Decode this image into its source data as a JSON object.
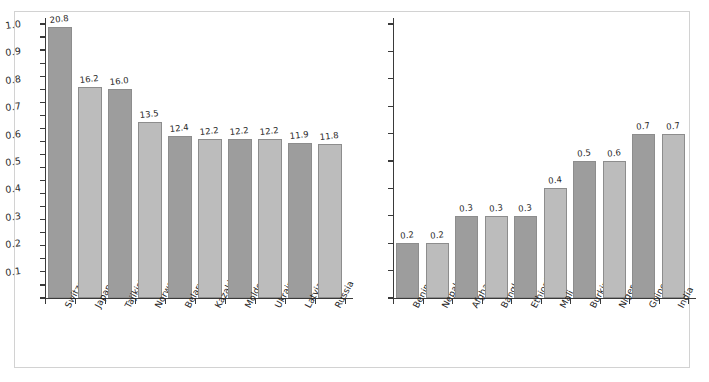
{
  "figure": {
    "background": "#ffffff",
    "frame_color": "#d2d2d2",
    "axis_color": "#3a3a3a",
    "bar_color_dark": "#9d9d9d",
    "bar_color_light": "#bcbcbc",
    "style": "hand-drawn",
    "panel_count": 2
  },
  "chart_data": [
    {
      "type": "bar",
      "title": "",
      "xlabel": "",
      "ylabel": "",
      "ylim": [
        0,
        21
      ],
      "grid": false,
      "legend": null,
      "yticks": [
        0,
        1,
        2,
        3,
        4,
        5,
        6,
        7,
        8,
        9,
        10,
        11,
        12,
        13,
        14,
        15,
        16,
        17,
        18,
        19,
        20,
        21
      ],
      "ytick_labels": [
        "0",
        "1",
        "2",
        "3",
        "4",
        "5",
        "6",
        "7",
        "8",
        "9",
        "10",
        "11",
        "12",
        "13",
        "14",
        "15",
        "16",
        "17",
        "18",
        "19",
        "20",
        "21"
      ],
      "categories": [
        "Switzerland",
        "Japan",
        "Tajikistan",
        "Norway",
        "Belarus",
        "Kazakhstan",
        "Moldova",
        "Ukraine",
        "Latvia",
        "Russia"
      ],
      "values": [
        20.8,
        16.2,
        16.0,
        13.5,
        12.4,
        12.2,
        12.2,
        12.2,
        11.9,
        11.8
      ],
      "bar_heights": [
        20.8,
        16.2,
        16.0,
        13.5,
        12.4,
        12.2,
        12.2,
        12.2,
        11.9,
        11.8
      ],
      "value_labels": [
        "20.8",
        "16.2",
        "16.0",
        "13.5",
        "12.4",
        "12.2",
        "12.2",
        "12.2",
        "11.9",
        "11.8"
      ]
    },
    {
      "type": "bar",
      "title": "",
      "xlabel": "",
      "ylabel": "",
      "ylim": [
        0,
        1.0
      ],
      "grid": false,
      "legend": null,
      "yticks": [
        0,
        0.1,
        0.2,
        0.3,
        0.4,
        0.5,
        0.6,
        0.7,
        0.8,
        0.9,
        1.0
      ],
      "ytick_labels": [
        "0",
        "0.1",
        "0.2",
        "0.3",
        "0.4",
        "0.5",
        "0.6",
        "0.7",
        "0.8",
        "0.9",
        "1.0"
      ],
      "categories": [
        "Benin",
        "Nepal",
        "Afghanistan",
        "Bangladesh",
        "Ethiopia",
        "Mali",
        "Burkina",
        "Niger",
        "Guinea",
        "India"
      ],
      "values": [
        0.2,
        0.2,
        0.3,
        0.3,
        0.3,
        0.4,
        0.5,
        0.6,
        0.7,
        0.7
      ],
      "bar_heights": [
        0.2,
        0.2,
        0.3,
        0.3,
        0.3,
        0.4,
        0.5,
        0.5,
        0.6,
        0.6
      ],
      "value_labels": [
        "0.2",
        "0.2",
        "0.3",
        "0.3",
        "0.3",
        "0.4",
        "0.5",
        "0.6",
        "0.7",
        "0.7"
      ]
    }
  ]
}
